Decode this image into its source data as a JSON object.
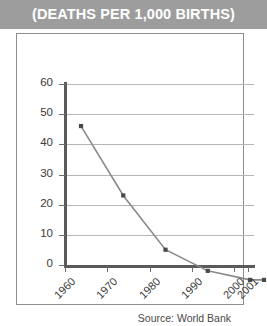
{
  "header": {
    "title": "(DEATHS PER 1,000 BIRTHS)"
  },
  "footer": {
    "source": "Source: World Bank"
  },
  "colors": {
    "header_band": "#9d9d9d",
    "header_text": "#ffffff",
    "card_border": "#8e8e8e",
    "gridline": "#b5b5b5",
    "axis": "#5a5a5a",
    "series_line": "#8a8a8a",
    "marker": "#4a4a4a",
    "tick_label": "#3a3a3a"
  },
  "chart_data": {
    "type": "line",
    "title": "(DEATHS PER 1,000 BIRTHS)",
    "xlabel": "",
    "ylabel": "",
    "x": [
      "1960",
      "1970",
      "1980",
      "1990",
      "2000",
      "2001"
    ],
    "values": [
      57,
      34,
      16,
      9,
      6,
      6
    ],
    "series": [
      {
        "name": "Infant mortality rate",
        "values": [
          57,
          34,
          16,
          9,
          6,
          6
        ]
      }
    ],
    "ylim": [
      0,
      60
    ],
    "yticks": [
      0,
      10,
      20,
      30,
      40,
      50,
      60
    ],
    "ytick_labels": [
      "0",
      "10",
      "20",
      "30",
      "40",
      "50",
      "60"
    ],
    "xtick_labels": [
      "1960",
      "1970",
      "1980",
      "1990",
      "2000",
      "2001"
    ],
    "grid": true,
    "grid_axis": "y",
    "legend": false,
    "legend_position": "none",
    "marker": "square",
    "annotations": [
      "Source: World Bank"
    ]
  }
}
